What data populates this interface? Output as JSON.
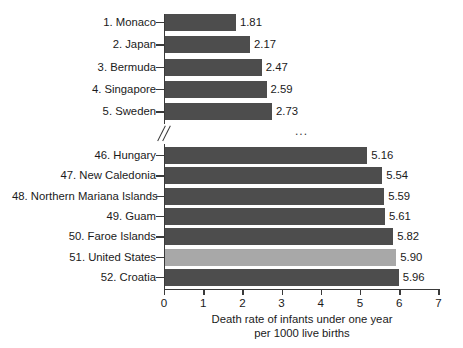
{
  "chart_data": {
    "type": "bar",
    "orientation": "horizontal",
    "title": "",
    "xlabel_line1": "Death rate of infants under one year",
    "xlabel_line2": "per 1000 live births",
    "ylabel": "",
    "xlim": [
      0,
      7
    ],
    "xticks": [
      0,
      1,
      2,
      3,
      4,
      5,
      6,
      7
    ],
    "xtick_labels": [
      "0",
      "1",
      "2",
      "3",
      "4",
      "5",
      "6",
      "7"
    ],
    "grid": false,
    "legend": "none",
    "axis_break_after_index": 4,
    "axis_break_symbol": "...",
    "categories": [
      "1. Monaco",
      "2. Japan",
      "3. Bermuda",
      "4. Singapore",
      "5. Sweden",
      "46. Hungary",
      "47. New Caledonia",
      "48. Northern Mariana Islands",
      "49. Guam",
      "50. Faroe Islands",
      "51. United States",
      "52. Croatia"
    ],
    "values": [
      1.81,
      2.17,
      2.47,
      2.59,
      2.73,
      5.16,
      5.54,
      5.59,
      5.61,
      5.82,
      5.9,
      5.96
    ],
    "value_labels": [
      "1.81",
      "2.17",
      "2.47",
      "2.59",
      "2.73",
      "5.16",
      "5.54",
      "5.59",
      "5.61",
      "5.82",
      "5.90",
      "5.96"
    ],
    "highlighted_category": "51. United States",
    "colors": {
      "bar": "#4d4d4d",
      "bar_highlight": "#a8a8a8",
      "axis": "#3a3a3a",
      "text": "#1a1a1a",
      "background": "#ffffff"
    }
  }
}
